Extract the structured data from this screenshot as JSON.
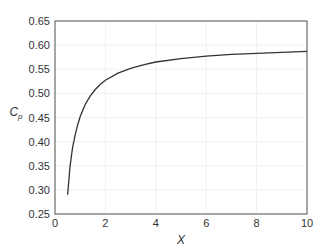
{
  "chart_data": {
    "type": "line",
    "title": "",
    "xlabel": "X",
    "ylabel": "C",
    "ylabel_subscript": "p",
    "xlim": [
      0,
      10
    ],
    "ylim": [
      0.25,
      0.65
    ],
    "xticks": [
      0,
      2,
      4,
      6,
      8,
      10
    ],
    "xtick_labels": [
      "0",
      "2",
      "4",
      "6",
      "8",
      "10"
    ],
    "yticks": [
      0.25,
      0.3,
      0.35,
      0.4,
      0.45,
      0.5,
      0.55,
      0.6,
      0.65
    ],
    "ytick_labels": [
      "0.25",
      "0.30",
      "0.35",
      "0.40",
      "0.45",
      "0.50",
      "0.55",
      "0.60",
      "0.65"
    ],
    "grid": true,
    "legend": "none",
    "series": [
      {
        "name": "Cp",
        "color": "#333333",
        "x": [
          0.5,
          0.6,
          0.7,
          0.8,
          0.9,
          1.0,
          1.2,
          1.4,
          1.6,
          1.8,
          2.0,
          2.5,
          3.0,
          3.5,
          4.0,
          5.0,
          6.0,
          7.0,
          8.0,
          9.0,
          10.0
        ],
        "y": [
          0.29,
          0.35,
          0.388,
          0.414,
          0.435,
          0.452,
          0.477,
          0.495,
          0.508,
          0.519,
          0.527,
          0.542,
          0.552,
          0.559,
          0.565,
          0.572,
          0.577,
          0.581,
          0.583,
          0.585,
          0.587
        ]
      }
    ]
  }
}
